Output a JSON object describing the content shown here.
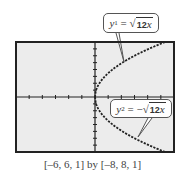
{
  "chart_data": {
    "type": "line",
    "title": "",
    "xlabel": "",
    "ylabel": "",
    "xlim": [
      -6,
      6
    ],
    "ylim": [
      -8,
      8
    ],
    "xscale": 1,
    "yscale": 1,
    "grid": false,
    "window_caption": "[–6, 6, 1] by [–8, 8, 1]",
    "series": [
      {
        "name": "y1 = √12x",
        "label": {
          "var": "y",
          "sub": "1",
          "eq": " = ",
          "neg": "",
          "radicand_num": "12",
          "radicand_var": "x"
        },
        "x": [
          0,
          0.25,
          0.5,
          1,
          1.5,
          2,
          2.5,
          3,
          3.5,
          4,
          4.5,
          5,
          5.5,
          6
        ],
        "values": [
          0,
          1.73,
          2.45,
          3.46,
          4.24,
          4.9,
          5.48,
          6,
          6.48,
          6.93,
          7.35,
          7.75,
          8.12,
          8.49
        ],
        "style": "dotted"
      },
      {
        "name": "y2 = −√12x",
        "label": {
          "var": "y",
          "sub": "2",
          "eq": " = ",
          "neg": "−",
          "radicand_num": "12",
          "radicand_var": "x"
        },
        "x": [
          0,
          0.25,
          0.5,
          1,
          1.5,
          2,
          2.5,
          3,
          3.5,
          4,
          4.5,
          5,
          5.5,
          6
        ],
        "values": [
          0,
          -1.73,
          -2.45,
          -3.46,
          -4.24,
          -4.9,
          -5.48,
          -6,
          -6.48,
          -6.93,
          -7.35,
          -7.75,
          -8.12,
          -8.49
        ],
        "style": "dotted"
      }
    ]
  },
  "colors": {
    "screen_bg": "#ececec",
    "frame": "#222222",
    "curve": "#222222",
    "text": "#444444"
  }
}
